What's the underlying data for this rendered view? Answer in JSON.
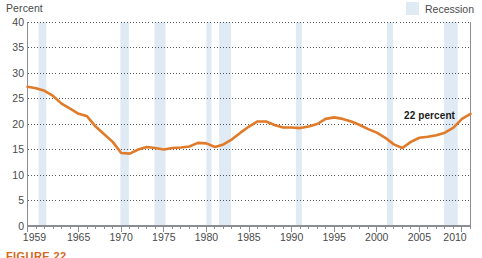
{
  "figure": {
    "caption_partial": "FIGURE 22"
  },
  "legend": {
    "label": "Recession",
    "swatch_color": "#dfeaf5",
    "position": "top-right"
  },
  "annotation": {
    "label": "22 percent",
    "value": 22,
    "year": 2010
  },
  "colors": {
    "line": "#e07b2a",
    "recession_band": "#dfeaf5",
    "gridline": "#55585c",
    "axis": "#8a8d91",
    "text": "#4a4a4a"
  },
  "chart_data": {
    "type": "line",
    "title": "",
    "subtitle": "",
    "xlabel": "",
    "ylabel": "Percent",
    "ylim": [
      0,
      40
    ],
    "xlim": [
      1959,
      2011
    ],
    "ytick_labels": [
      "0",
      "5",
      "10",
      "15",
      "20",
      "25",
      "30",
      "35",
      "40"
    ],
    "yticks": [
      0,
      5,
      10,
      15,
      20,
      25,
      30,
      35,
      40
    ],
    "xtick_labels": [
      "1959",
      "1965",
      "1970",
      "1975",
      "1980",
      "1985",
      "1990",
      "1995",
      "2000",
      "2005",
      "2010"
    ],
    "xticks": [
      1959,
      1965,
      1970,
      1975,
      1980,
      1985,
      1990,
      1995,
      2000,
      2005,
      2010
    ],
    "minor_xtick_step": 1,
    "grid": "horizontal-dotted",
    "legend_position": "top-right",
    "series": [
      {
        "name": "Percent",
        "color": "#e07b2a",
        "x": [
          1959,
          1960,
          1961,
          1962,
          1963,
          1964,
          1965,
          1966,
          1967,
          1968,
          1969,
          1970,
          1971,
          1972,
          1973,
          1974,
          1975,
          1976,
          1977,
          1978,
          1979,
          1980,
          1981,
          1982,
          1983,
          1984,
          1985,
          1986,
          1987,
          1988,
          1989,
          1990,
          1991,
          1992,
          1993,
          1994,
          1995,
          1996,
          1997,
          1998,
          1999,
          2000,
          2001,
          2002,
          2003,
          2004,
          2005,
          2006,
          2007,
          2008,
          2009,
          2010,
          2011
        ],
        "values": [
          27.3,
          27.0,
          26.5,
          25.5,
          24.0,
          23.0,
          22.0,
          21.5,
          19.5,
          18.0,
          16.5,
          14.3,
          14.2,
          15.0,
          15.5,
          15.3,
          15.0,
          15.3,
          15.4,
          15.6,
          16.3,
          16.2,
          15.5,
          16.0,
          17.0,
          18.3,
          19.5,
          20.5,
          20.5,
          19.8,
          19.3,
          19.3,
          19.2,
          19.5,
          20.0,
          21.0,
          21.3,
          21.0,
          20.5,
          19.8,
          19.0,
          18.3,
          17.3,
          16.0,
          15.3,
          16.5,
          17.3,
          17.5,
          17.8,
          18.3,
          19.3,
          21.0,
          22.0
        ]
      }
    ],
    "recession_bands": [
      {
        "start": 1960.3,
        "end": 1961.2
      },
      {
        "start": 1969.9,
        "end": 1970.9
      },
      {
        "start": 1973.9,
        "end": 1975.2
      },
      {
        "start": 1980.0,
        "end": 1980.6
      },
      {
        "start": 1981.5,
        "end": 1982.9
      },
      {
        "start": 1990.5,
        "end": 1991.2
      },
      {
        "start": 2001.2,
        "end": 2001.9
      },
      {
        "start": 2007.9,
        "end": 2009.5
      }
    ]
  }
}
